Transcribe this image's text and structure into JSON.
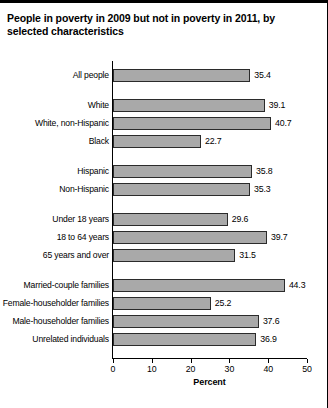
{
  "chart_data": {
    "type": "bar",
    "orientation": "horizontal",
    "title": "People in poverty in 2009 but not in poverty in 2011, by selected characteristics",
    "xlabel": "Percent",
    "ylabel": "",
    "xlim": [
      0,
      50
    ],
    "xticks": [
      0,
      10,
      20,
      30,
      40,
      50
    ],
    "xtick_labels": [
      "0",
      "10",
      "20",
      "30",
      "40",
      "50"
    ],
    "grid": false,
    "legend": "none",
    "bar_color": "#a9a9a9",
    "bar_border_color": "#2b2b2b",
    "groups": [
      {
        "name": "total",
        "categories": [
          "All people"
        ],
        "values": [
          35.4
        ]
      },
      {
        "name": "race",
        "categories": [
          "White",
          "White, non-Hispanic",
          "Black"
        ],
        "values": [
          39.1,
          40.7,
          22.7
        ]
      },
      {
        "name": "ethnicity",
        "categories": [
          "Hispanic",
          "Non-Hispanic"
        ],
        "values": [
          35.8,
          35.3
        ]
      },
      {
        "name": "age",
        "categories": [
          "Under 18 years",
          "18 to 64 years",
          "65 years and over"
        ],
        "values": [
          29.6,
          39.7,
          31.5
        ]
      },
      {
        "name": "family-type",
        "categories": [
          "Married-couple families",
          "Female-householder families",
          "Male-householder families",
          "Unrelated individuals"
        ],
        "values": [
          44.3,
          25.2,
          37.6,
          36.9
        ]
      }
    ],
    "categories": [
      "All people",
      "White",
      "White, non-Hispanic",
      "Black",
      "Hispanic",
      "Non-Hispanic",
      "Under 18 years",
      "18 to 64 years",
      "65 years and over",
      "Married-couple families",
      "Female-householder families",
      "Male-householder families",
      "Unrelated individuals"
    ],
    "values": [
      35.4,
      39.1,
      40.7,
      22.7,
      35.8,
      35.3,
      29.6,
      39.7,
      31.5,
      44.3,
      25.2,
      37.6,
      36.9
    ],
    "value_labels": [
      "35.4",
      "39.1",
      "40.7",
      "22.7",
      "35.8",
      "35.3",
      "29.6",
      "39.7",
      "31.5",
      "44.3",
      "25.2",
      "37.6",
      "36.9"
    ]
  }
}
